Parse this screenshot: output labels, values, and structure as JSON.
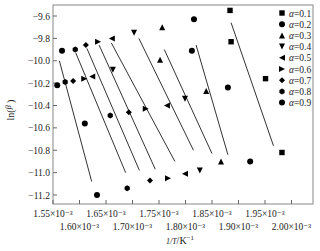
{
  "chart_data": {
    "type": "scatter",
    "title": "",
    "xlabel": "1/T /K^-1",
    "ylabel": "ln(β/T²)",
    "x_tick_labels_upper": [
      "1.55×10⁻³",
      "1.65×10⁻³",
      "1.75×10⁻³",
      "1.85×10⁻³",
      "1.95×10⁻³"
    ],
    "x_tick_labels_lower": [
      "1.60×10⁻³",
      "1.70×10⁻³",
      "1.80×10⁻³",
      "1.90×10⁻³",
      "2.00×10⁻³"
    ],
    "x_ticks": [
      0.00155,
      0.0016,
      0.00165,
      0.0017,
      0.00175,
      0.0018,
      0.00185,
      0.0019,
      0.00195,
      0.002
    ],
    "y_ticks": [
      -9.6,
      -9.8,
      -10.0,
      -10.2,
      -10.4,
      -10.6,
      -10.8,
      -11.0,
      -11.2
    ],
    "y_tick_labels": [
      "−9.6",
      "−9.8",
      "−10.0",
      "−10.2",
      "−10.4",
      "−10.6",
      "−10.8",
      "−11.0",
      "−11.2"
    ],
    "xlim": [
      0.00155,
      0.00204
    ],
    "ylim": [
      -11.3,
      -9.5
    ],
    "grid": false,
    "legend_position": "top-right",
    "series": [
      {
        "name": "α=0.1",
        "marker": "square",
        "x": [
          0.001884,
          0.001886,
          0.001951,
          0.001982
        ],
        "y": [
          -9.55,
          -9.83,
          -10.16,
          -10.82
        ]
      },
      {
        "name": "α=0.2",
        "marker": "circle",
        "x": [
          0.001816,
          0.001812,
          0.00188,
          0.001922
        ],
        "y": [
          -9.63,
          -9.91,
          -10.24,
          -10.9
        ]
      },
      {
        "name": "α=0.3",
        "marker": "triangle-up",
        "x": [
          0.001756,
          0.001752,
          0.001839,
          0.001867
        ],
        "y": [
          -9.7,
          -9.99,
          -10.27,
          -10.9
        ]
      },
      {
        "name": "α=0.4",
        "marker": "triangle-down",
        "x": [
          0.001703,
          0.001663,
          0.001799,
          0.001827
        ],
        "y": [
          -9.75,
          -10.08,
          -10.34,
          -10.98
        ]
      },
      {
        "name": "α=0.5",
        "marker": "triangle-left",
        "x": [
          0.001661,
          0.001624,
          0.001765,
          0.001799
        ],
        "y": [
          -9.8,
          -10.14,
          -10.4,
          -11.01
        ]
      },
      {
        "name": "α=0.6",
        "marker": "triangle-right",
        "x": [
          0.001635,
          0.001609,
          0.001725,
          0.001767
        ],
        "y": [
          -9.83,
          -10.16,
          -10.43,
          -11.05
        ]
      },
      {
        "name": "α=0.7",
        "marker": "diamond",
        "x": [
          0.001612,
          0.001588,
          0.001693,
          0.001733
        ],
        "y": [
          -9.86,
          -10.18,
          -10.46,
          -11.07
        ]
      },
      {
        "name": "α=0.8",
        "marker": "hexagon",
        "x": [
          0.001592,
          0.001573,
          0.001658,
          0.00169
        ],
        "y": [
          -9.9,
          -10.19,
          -10.49,
          -11.14
        ]
      },
      {
        "name": "α=0.9",
        "marker": "circle",
        "x": [
          0.001567,
          0.001558,
          0.00161,
          0.001633
        ],
        "y": [
          -9.91,
          -10.22,
          -10.56,
          -11.2
        ]
      }
    ],
    "fit_lines": [
      {
        "name": "α=0.1 fit",
        "x": [
          0.001886,
          0.001966
        ],
        "y": [
          -9.66,
          -10.76
        ]
      },
      {
        "name": "α=0.2 fit",
        "x": [
          0.00182,
          0.00188
        ],
        "y": [
          -9.86,
          -10.84
        ]
      },
      {
        "name": "α=0.3 fit",
        "x": [
          0.00176,
          0.00185
        ],
        "y": [
          -9.9,
          -10.83
        ]
      },
      {
        "name": "α=0.4 fit",
        "x": [
          0.001712,
          0.001815
        ],
        "y": [
          -9.8,
          -10.8
        ]
      },
      {
        "name": "α=0.5 fit",
        "x": [
          0.00166,
          0.00178
        ],
        "y": [
          -9.84,
          -10.9
        ]
      },
      {
        "name": "α=0.6 fit",
        "x": [
          0.001637,
          0.001743
        ],
        "y": [
          -9.86,
          -10.97
        ]
      },
      {
        "name": "α=0.7 fit",
        "x": [
          0.001614,
          0.001713
        ],
        "y": [
          -9.89,
          -10.98
        ]
      },
      {
        "name": "α=0.8 fit",
        "x": [
          0.001593,
          0.001687
        ],
        "y": [
          -9.93,
          -11.0
        ]
      },
      {
        "name": "α=0.9 fit",
        "x": [
          0.001562,
          0.001623
        ],
        "y": [
          -10.0,
          -11.08
        ]
      }
    ]
  }
}
